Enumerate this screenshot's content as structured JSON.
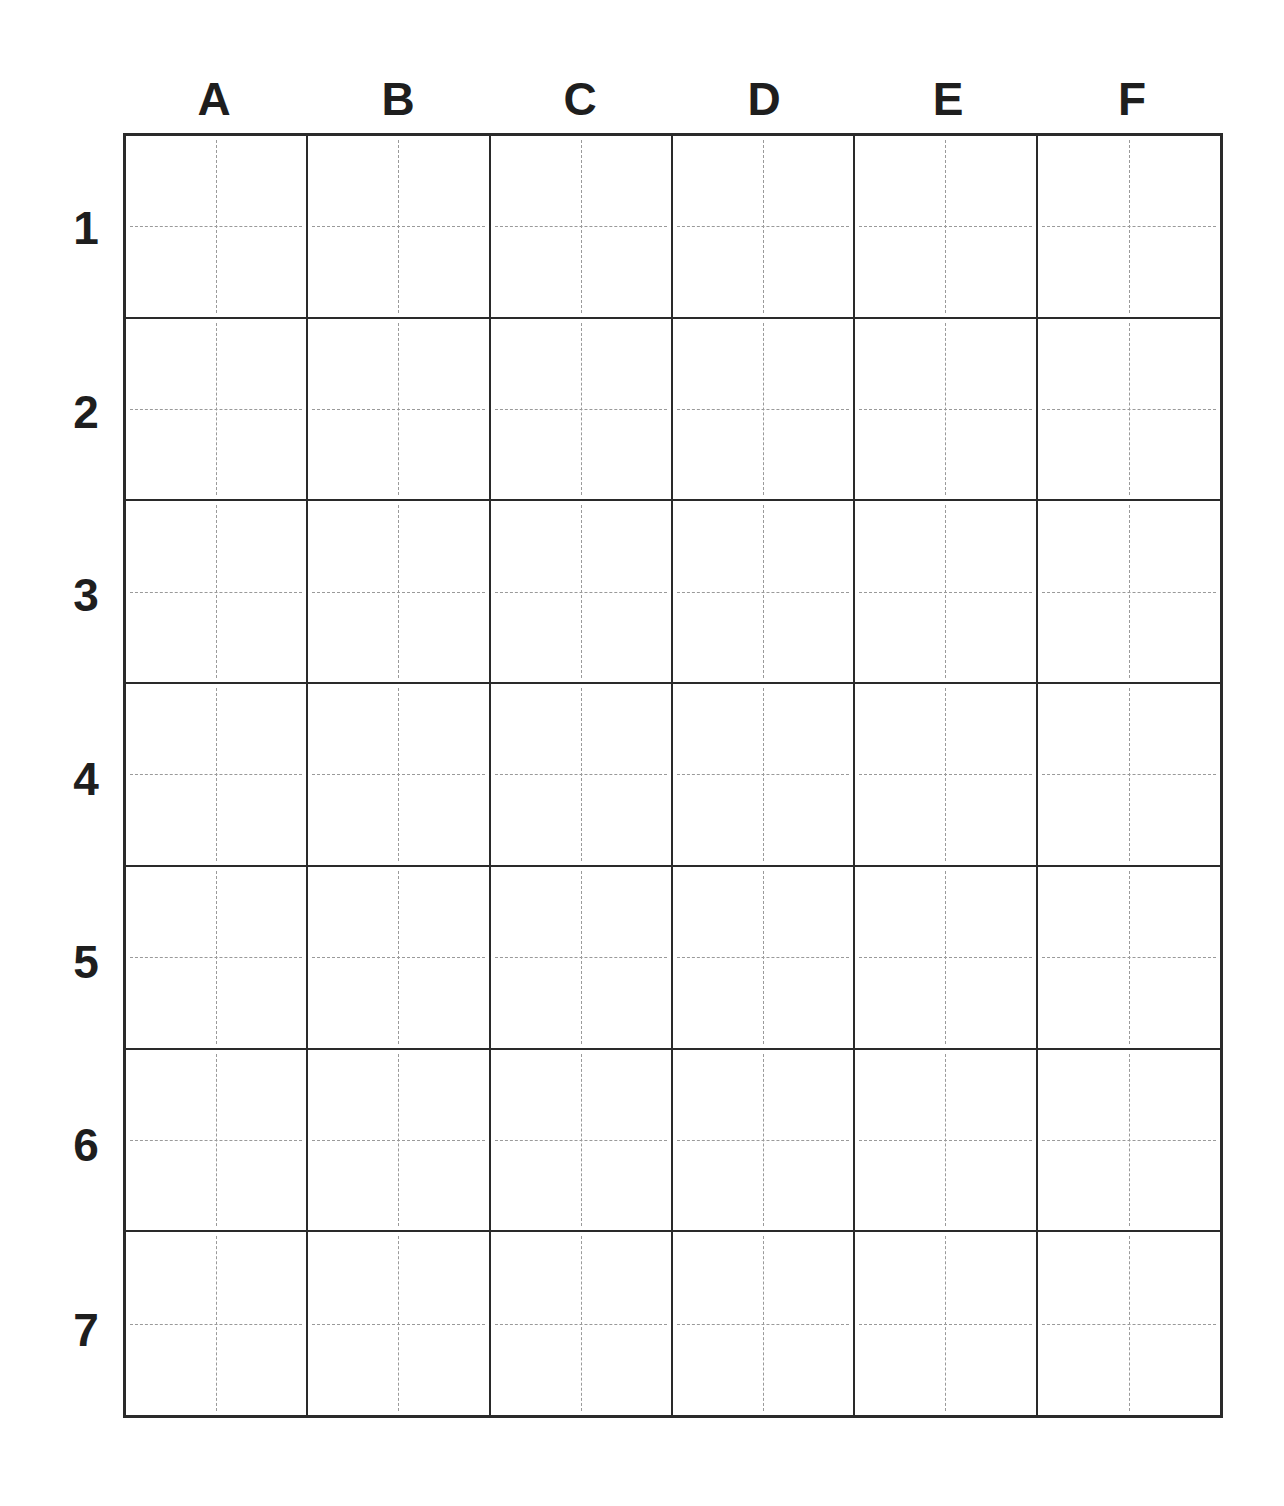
{
  "board": {
    "columns": [
      "A",
      "B",
      "C",
      "D",
      "E",
      "F"
    ],
    "rows": [
      "1",
      "2",
      "3",
      "4",
      "5",
      "6",
      "7"
    ],
    "colors": {
      "grid_line": "#2a2a2a",
      "guide_line": "#9a9a9a",
      "label": "#1e1e1e",
      "background": "#ffffff"
    }
  }
}
